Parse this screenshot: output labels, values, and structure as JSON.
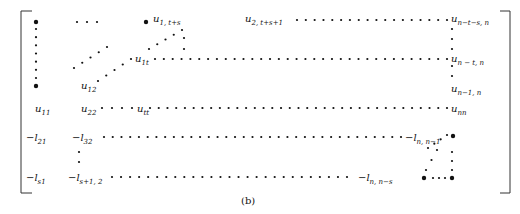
{
  "figure": {
    "caption": "(b)",
    "labels": [
      {
        "id": "u1ts",
        "base": "u",
        "sub": "1, t+s",
        "x": 153,
        "y": 14
      },
      {
        "id": "u2ts1",
        "base": "u",
        "sub": "2, t+s+1",
        "x": 245,
        "y": 14
      },
      {
        "id": "unts",
        "base": "u",
        "sub": "n−t−s, n",
        "x": 451,
        "y": 14
      },
      {
        "id": "u1t",
        "base": "u",
        "sub": "1t",
        "x": 135,
        "y": 54
      },
      {
        "id": "untn",
        "base": "u",
        "sub": "n − t, n",
        "x": 451,
        "y": 54
      },
      {
        "id": "u12",
        "base": "u",
        "sub": "12",
        "x": 81,
        "y": 81
      },
      {
        "id": "un1n",
        "base": "u",
        "sub": "n−1, n",
        "x": 451,
        "y": 84
      },
      {
        "id": "u11",
        "base": "u",
        "sub": "11",
        "x": 35,
        "y": 104
      },
      {
        "id": "u22",
        "base": "u",
        "sub": "22",
        "x": 81,
        "y": 104
      },
      {
        "id": "utt",
        "base": "u",
        "sub": "tt",
        "x": 137,
        "y": 104
      },
      {
        "id": "unn",
        "base": "u",
        "sub": "nn",
        "x": 451,
        "y": 104
      },
      {
        "id": "l21",
        "base": "−l",
        "sub": "21",
        "x": 26,
        "y": 133
      },
      {
        "id": "l32",
        "base": "−l",
        "sub": "32",
        "x": 72,
        "y": 133
      },
      {
        "id": "lnn1",
        "base": "−l",
        "sub": "n, n−1",
        "x": 405,
        "y": 133
      },
      {
        "id": "ls1",
        "base": "−l",
        "sub": "s1",
        "x": 26,
        "y": 173
      },
      {
        "id": "ls12",
        "base": "−l",
        "sub": "s+1, 2",
        "x": 68,
        "y": 173
      },
      {
        "id": "lnns",
        "base": "−l",
        "sub": "n, n−s",
        "x": 358,
        "y": 173
      }
    ]
  }
}
